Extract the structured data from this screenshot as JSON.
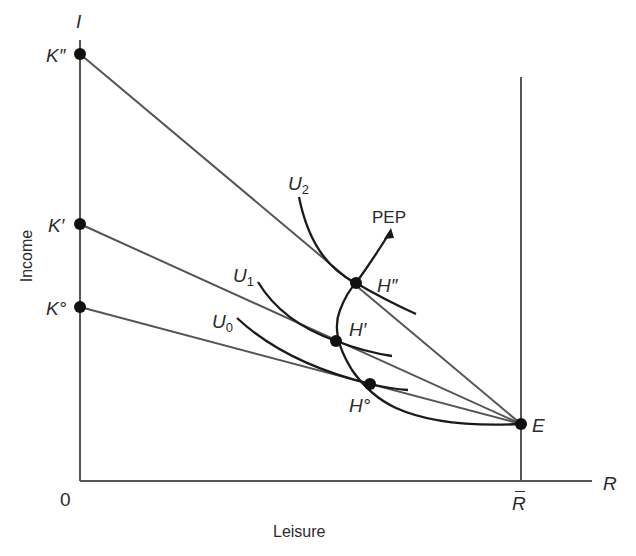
{
  "diagram": {
    "axes": {
      "y_axis_symbol": "I",
      "x_axis_symbol": "R",
      "origin_label": "0",
      "y_title": "Income",
      "x_title": "Leisure",
      "x_mark_label": "R",
      "x_mark_label_has_bar": true
    },
    "intercepts": {
      "k_double_prime": "K″",
      "k_prime": "K′",
      "k_zero": "K°"
    },
    "endowment_point": "E",
    "tangency_points": {
      "h_double_prime": "H″",
      "h_prime": "H′",
      "h_zero": "H°"
    },
    "indifference_curves": {
      "u0": {
        "base": "U",
        "sub": "0"
      },
      "u1": {
        "base": "U",
        "sub": "1"
      },
      "u2": {
        "base": "U",
        "sub": "2"
      }
    },
    "path_label": "PEP",
    "colors": {
      "ink": "#2b2b2b",
      "line_gray": "#555555",
      "background": "#ffffff"
    }
  }
}
